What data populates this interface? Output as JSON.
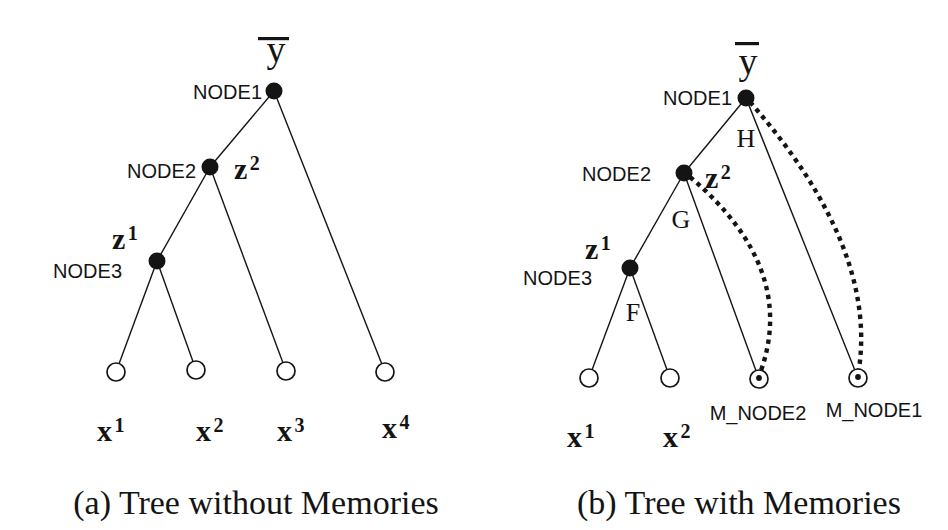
{
  "figure": {
    "background": "#ffffff",
    "ink": "#141414",
    "styles": {
      "node_radius": 8.5,
      "leaf_radius": 9,
      "memory_dot_radius": 2.9,
      "edge_width": 1.4,
      "leaf_stroke_width": 1.7,
      "dotted_width": 4.4,
      "dash_pattern": "4.4 4.6",
      "node_label_size": 20,
      "var_label_size": 30,
      "sup_size": 20,
      "edge_label_size": 26,
      "root_size": 38,
      "caption_size": 34,
      "memory_label_size": 20
    },
    "panels": [
      {
        "name": "tree-without-memories",
        "caption": {
          "text": "(a) Tree without Memories",
          "x": 256,
          "y": 514
        },
        "root_var": {
          "base": "y",
          "x": 276,
          "y": 62,
          "bar": {
            "x": 258,
            "y": 37,
            "w": 31,
            "h": 3.2
          }
        },
        "internal_nodes": [
          {
            "id": "NODE1",
            "x": 274,
            "y": 91,
            "label": "NODE1",
            "lx": 262,
            "ly": 99,
            "align": "end"
          },
          {
            "id": "NODE2",
            "x": 210,
            "y": 167,
            "label": "NODE2",
            "lx": 196,
            "ly": 178,
            "align": "end"
          },
          {
            "id": "NODE3",
            "x": 157,
            "y": 261,
            "label": "NODE3",
            "lx": 122,
            "ly": 278,
            "align": "end"
          }
        ],
        "var_labels": [
          {
            "base": "z",
            "sup": "2",
            "x": 234,
            "y": 179
          },
          {
            "base": "z",
            "sup": "1",
            "x": 112,
            "y": 249
          }
        ],
        "edge_labels": [],
        "leaves": [
          {
            "x": 116,
            "y": 372,
            "memory": false,
            "label": {
              "base": "x",
              "sup": "1",
              "x": 97,
              "y": 441
            }
          },
          {
            "x": 196,
            "y": 370,
            "memory": false,
            "label": {
              "base": "x",
              "sup": "2",
              "x": 196,
              "y": 441
            }
          },
          {
            "x": 286,
            "y": 371,
            "memory": false,
            "label": {
              "base": "x",
              "sup": "3",
              "x": 277,
              "y": 441
            }
          },
          {
            "x": 385,
            "y": 372,
            "memory": false,
            "label": {
              "base": "x",
              "sup": "4",
              "x": 382,
              "y": 438
            }
          }
        ],
        "memory_labels": [],
        "edges": [
          [
            274,
            91,
            210,
            167
          ],
          [
            274,
            91,
            385,
            372
          ],
          [
            210,
            167,
            157,
            261
          ],
          [
            210,
            167,
            286,
            371
          ],
          [
            157,
            261,
            116,
            372
          ],
          [
            157,
            261,
            196,
            370
          ]
        ],
        "memory_links": []
      },
      {
        "name": "tree-with-memories",
        "caption": {
          "text": "(b) Tree with Memories",
          "x": 739,
          "y": 514
        },
        "root_var": {
          "base": "y",
          "x": 748,
          "y": 74,
          "bar": {
            "x": 735,
            "y": 42,
            "w": 24,
            "h": 3.2
          }
        },
        "internal_nodes": [
          {
            "id": "NODE1",
            "x": 746,
            "y": 98,
            "label": "NODE1",
            "lx": 732,
            "ly": 105,
            "align": "end"
          },
          {
            "id": "NODE2",
            "x": 684,
            "y": 173,
            "label": "NODE2",
            "lx": 651,
            "ly": 181,
            "align": "end"
          },
          {
            "id": "NODE3",
            "x": 630,
            "y": 268,
            "label": "NODE3",
            "lx": 592,
            "ly": 285,
            "align": "end"
          }
        ],
        "var_labels": [
          {
            "base": "z",
            "sup": "2",
            "x": 705,
            "y": 188
          },
          {
            "base": "z",
            "sup": "1",
            "x": 585,
            "y": 259
          }
        ],
        "edge_labels": [
          {
            "text": "H",
            "x": 746,
            "y": 147
          },
          {
            "text": "G",
            "x": 681,
            "y": 228
          },
          {
            "text": "F",
            "x": 633,
            "y": 321
          }
        ],
        "leaves": [
          {
            "x": 589,
            "y": 378,
            "memory": false,
            "label": {
              "base": "x",
              "sup": "1",
              "x": 567,
              "y": 447
            }
          },
          {
            "x": 670,
            "y": 378,
            "memory": false,
            "label": {
              "base": "x",
              "sup": "2",
              "x": 663,
              "y": 447
            }
          },
          {
            "x": 759,
            "y": 379,
            "memory": true
          },
          {
            "x": 858,
            "y": 378,
            "memory": true
          }
        ],
        "memory_labels": [
          {
            "text": "M_NODE2",
            "x": 758,
            "y": 420
          },
          {
            "text": "M_NODE1",
            "x": 874,
            "y": 417
          }
        ],
        "edges": [
          [
            746,
            98,
            684,
            173
          ],
          [
            746,
            98,
            858,
            378
          ],
          [
            684,
            173,
            630,
            268
          ],
          [
            684,
            173,
            759,
            379
          ],
          [
            630,
            268,
            589,
            378
          ],
          [
            630,
            268,
            670,
            378
          ]
        ],
        "memory_links": [
          "M 690 177 Q 800 270 759 376",
          "M 750 102 Q 880 250 858 375"
        ]
      }
    ]
  }
}
